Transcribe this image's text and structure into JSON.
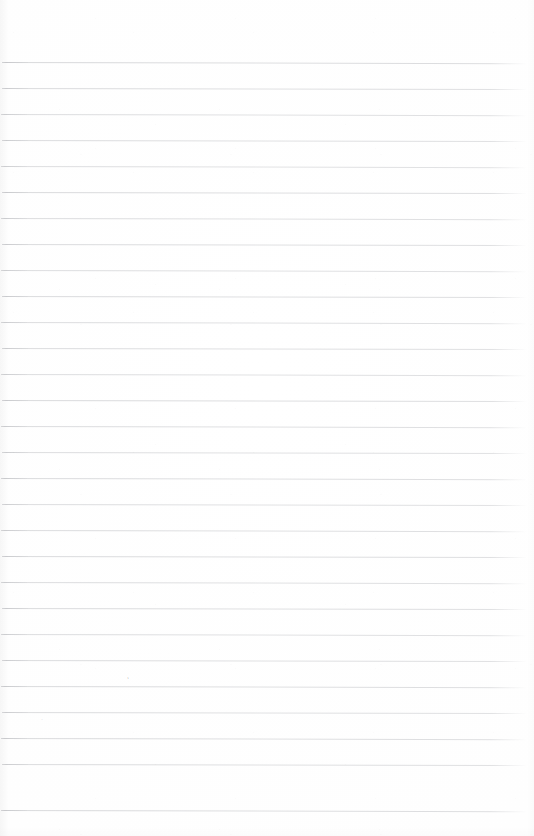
{
  "document": {
    "kind": "scanned-ruled-paper",
    "description": "Blank scanned sheet of ruled notebook paper",
    "page_width": 534,
    "page_height": 836,
    "background_color": "#ffffff",
    "content_text": ""
  },
  "ruling": {
    "rule_color": "#9a9ca2",
    "rule_count": 29,
    "line_spacing": 26,
    "first_line_y": 62,
    "last_line_y": 810,
    "left_margin": 2,
    "right_margin": 7,
    "skew_degrees": 0.12,
    "lines": [
      {
        "index": 1,
        "y": 62,
        "x": 2,
        "width": 525,
        "skew": 0.14,
        "opacity": 0.62
      },
      {
        "index": 2,
        "y": 88,
        "x": 2,
        "width": 525,
        "skew": 0.12,
        "opacity": 0.58
      },
      {
        "index": 3,
        "y": 114,
        "x": 1,
        "width": 526,
        "skew": 0.13,
        "opacity": 0.55
      },
      {
        "index": 4,
        "y": 140,
        "x": 2,
        "width": 525,
        "skew": 0.11,
        "opacity": 0.57
      },
      {
        "index": 5,
        "y": 166,
        "x": 1,
        "width": 526,
        "skew": 0.13,
        "opacity": 0.54
      },
      {
        "index": 6,
        "y": 192,
        "x": 2,
        "width": 525,
        "skew": 0.12,
        "opacity": 0.6
      },
      {
        "index": 7,
        "y": 218,
        "x": 1,
        "width": 526,
        "skew": 0.14,
        "opacity": 0.56
      },
      {
        "index": 8,
        "y": 244,
        "x": 2,
        "width": 525,
        "skew": 0.12,
        "opacity": 0.58
      },
      {
        "index": 9,
        "y": 270,
        "x": 1,
        "width": 526,
        "skew": 0.13,
        "opacity": 0.55
      },
      {
        "index": 10,
        "y": 296,
        "x": 2,
        "width": 525,
        "skew": 0.11,
        "opacity": 0.59
      },
      {
        "index": 11,
        "y": 322,
        "x": 1,
        "width": 526,
        "skew": 0.13,
        "opacity": 0.56
      },
      {
        "index": 12,
        "y": 348,
        "x": 2,
        "width": 525,
        "skew": 0.12,
        "opacity": 0.57
      },
      {
        "index": 13,
        "y": 374,
        "x": 1,
        "width": 526,
        "skew": 0.14,
        "opacity": 0.55
      },
      {
        "index": 14,
        "y": 400,
        "x": 2,
        "width": 525,
        "skew": 0.12,
        "opacity": 0.6
      },
      {
        "index": 15,
        "y": 426,
        "x": 1,
        "width": 526,
        "skew": 0.13,
        "opacity": 0.57
      },
      {
        "index": 16,
        "y": 452,
        "x": 2,
        "width": 525,
        "skew": 0.11,
        "opacity": 0.56
      },
      {
        "index": 17,
        "y": 478,
        "x": 1,
        "width": 526,
        "skew": 0.13,
        "opacity": 0.58
      },
      {
        "index": 18,
        "y": 504,
        "x": 2,
        "width": 525,
        "skew": 0.12,
        "opacity": 0.55
      },
      {
        "index": 19,
        "y": 530,
        "x": 1,
        "width": 526,
        "skew": 0.14,
        "opacity": 0.57
      },
      {
        "index": 20,
        "y": 556,
        "x": 2,
        "width": 525,
        "skew": 0.12,
        "opacity": 0.59
      },
      {
        "index": 21,
        "y": 582,
        "x": 1,
        "width": 526,
        "skew": 0.13,
        "opacity": 0.56
      },
      {
        "index": 22,
        "y": 608,
        "x": 2,
        "width": 525,
        "skew": 0.12,
        "opacity": 0.58
      },
      {
        "index": 23,
        "y": 634,
        "x": 1,
        "width": 526,
        "skew": 0.13,
        "opacity": 0.55
      },
      {
        "index": 24,
        "y": 660,
        "x": 2,
        "width": 525,
        "skew": 0.11,
        "opacity": 0.57
      },
      {
        "index": 25,
        "y": 686,
        "x": 1,
        "width": 526,
        "skew": 0.13,
        "opacity": 0.59
      },
      {
        "index": 26,
        "y": 712,
        "x": 2,
        "width": 525,
        "skew": 0.12,
        "opacity": 0.56
      },
      {
        "index": 27,
        "y": 738,
        "x": 1,
        "width": 526,
        "skew": 0.14,
        "opacity": 0.58
      },
      {
        "index": 28,
        "y": 764,
        "x": 2,
        "width": 525,
        "skew": 0.12,
        "opacity": 0.57
      },
      {
        "index": 29,
        "y": 810,
        "x": 1,
        "width": 526,
        "skew": 0.13,
        "opacity": 0.6
      }
    ]
  },
  "annotations": {
    "pencil_marks": [
      {
        "id": "mark-a",
        "glyph": "′",
        "x": 128,
        "y": 676,
        "note": "faint stray pencil tick above rule 25"
      },
      {
        "id": "mark-b",
        "glyph": "·",
        "x": 41,
        "y": 716,
        "note": "faint stray pencil dot near left margin"
      }
    ]
  }
}
